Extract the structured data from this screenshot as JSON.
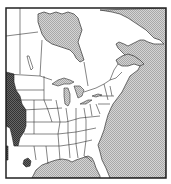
{
  "map": {
    "type": "species range map",
    "region": "Eastern North America",
    "legend": [],
    "colors": {
      "land": "#ffffff",
      "water": "#c8c8c8",
      "range": "#555555",
      "border": "#333333",
      "frame": "#222222"
    },
    "features": {
      "water_bodies": [
        "Hudson Bay",
        "Great Lakes",
        "Gulf of St. Lawrence",
        "Atlantic Ocean",
        "Gulf of Mexico"
      ],
      "range_areas": [
        "Great Plains (western edge)",
        "Texas (isolated patch)",
        "Southern Arizona/New Mexico edge"
      ]
    }
  }
}
